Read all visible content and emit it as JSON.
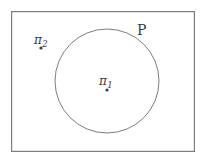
{
  "figure": {
    "background_color": "#ffffff",
    "stroke_color": "#7d7d7d",
    "text_color": "#3b3b3b",
    "outer_rectangle": {
      "name": "plane-boundary-rectangle",
      "x": 11,
      "y": 11,
      "width": 184,
      "height": 141,
      "stroke_width": 1.2
    },
    "circle": {
      "name": "closed-curve-P",
      "cx": 107,
      "cy": 81,
      "r": 52,
      "stroke_width": 1.0,
      "label": "P"
    },
    "points": [
      {
        "name": "point-pi-1",
        "label_base": "π",
        "label_sub": "1",
        "label_full": "π₁",
        "cx": 107,
        "cy": 90,
        "radius": 1.6,
        "inside_curve": true
      },
      {
        "name": "point-pi-2",
        "label_base": "π",
        "label_sub": "2",
        "label_full": "π₂",
        "cx": 41,
        "cy": 48,
        "radius": 1.6,
        "inside_curve": false
      }
    ],
    "curve_label": {
      "name": "curve-label-P",
      "text": "P",
      "x": 137,
      "y": 23
    }
  }
}
